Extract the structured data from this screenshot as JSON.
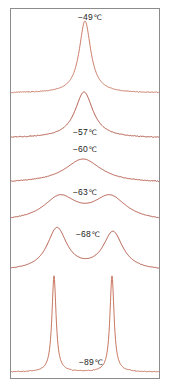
{
  "figure": {
    "name": "variable-temperature-nmr-stack",
    "background_color": "#ffffff",
    "frame_color": "#8c8c8c",
    "trace_color": "#a8422f",
    "trace_color_light": "#c2674f",
    "label_color": "#1c1c1c"
  },
  "labels": [
    {
      "id": "temp-49",
      "text": "−49",
      "unit": "℃",
      "x": 90,
      "y": 13
    },
    {
      "id": "temp-57",
      "text": "−57",
      "unit": "℃",
      "x": 85,
      "y": 128
    },
    {
      "id": "temp-60",
      "text": "−60",
      "unit": "℃",
      "x": 85,
      "y": 145
    },
    {
      "id": "temp-63",
      "text": "−63",
      "unit": "℃",
      "x": 85,
      "y": 188
    },
    {
      "id": "temp-68",
      "text": "−68",
      "unit": "℃",
      "x": 88,
      "y": 230
    },
    {
      "id": "temp-89",
      "text": "−89",
      "unit": "℃",
      "x": 91,
      "y": 358
    }
  ],
  "chart_data": {
    "type": "line",
    "title": "",
    "xlabel": "",
    "ylabel": "",
    "grid": false,
    "legend_position": "inline-annotations",
    "series": [
      {
        "name": "-49 ℃",
        "temperature_c": -49,
        "baseline_y": 93,
        "lineshape": "sharp singlet",
        "peaks": [
          {
            "center_x": 85,
            "height": 72,
            "half_width": 7
          }
        ]
      },
      {
        "name": "-57 ℃",
        "temperature_c": -57,
        "baseline_y": 138,
        "lineshape": "broadened singlet",
        "peaks": [
          {
            "center_x": 84,
            "height": 46,
            "half_width": 11
          }
        ]
      },
      {
        "name": "-60 ℃",
        "temperature_c": -60,
        "baseline_y": 183,
        "lineshape": "broad singlet near coalescence",
        "peaks": [
          {
            "center_x": 83,
            "height": 24,
            "half_width": 22
          }
        ]
      },
      {
        "name": "-63 ℃",
        "temperature_c": -63,
        "baseline_y": 222,
        "lineshape": "broad unresolved doublet",
        "peaks": [
          {
            "center_x": 60,
            "height": 24,
            "half_width": 20
          },
          {
            "center_x": 110,
            "height": 24,
            "half_width": 20
          }
        ]
      },
      {
        "name": "-68 ℃",
        "temperature_c": -68,
        "baseline_y": 271,
        "lineshape": "resolved doublet",
        "peaks": [
          {
            "center_x": 57,
            "height": 42,
            "half_width": 12
          },
          {
            "center_x": 113,
            "height": 38,
            "half_width": 12
          }
        ]
      },
      {
        "name": "-89 ℃",
        "temperature_c": -89,
        "baseline_y": 372,
        "lineshape": "sharp doublet",
        "peaks": [
          {
            "center_x": 54,
            "height": 96,
            "half_width": 2.5
          },
          {
            "center_x": 112,
            "height": 96,
            "half_width": 2.5
          }
        ]
      }
    ]
  }
}
